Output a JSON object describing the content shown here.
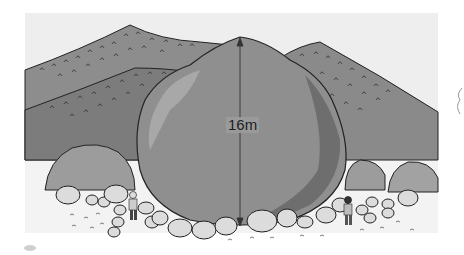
{
  "illustration": {
    "subject": "giant boulder with height marker",
    "height_label": "16m",
    "elements": [
      "sky",
      "back-hill-left",
      "back-hill-right",
      "front-hill-left",
      "giant-boulder",
      "height-arrow",
      "small-boulders",
      "rock-pile",
      "person-left",
      "person-right"
    ],
    "colors": {
      "sky": "#eeeeee",
      "hill_back": "#8c8c8c",
      "hill_front": "#7a7a7a",
      "boulder": "#8f8f8f",
      "boulder_light": "#a8a8a8",
      "boulder_shadow": "#6e6e6e",
      "ground": "#f3f3f3",
      "rocks": "#dcdcdc",
      "outline": "#222222"
    }
  }
}
